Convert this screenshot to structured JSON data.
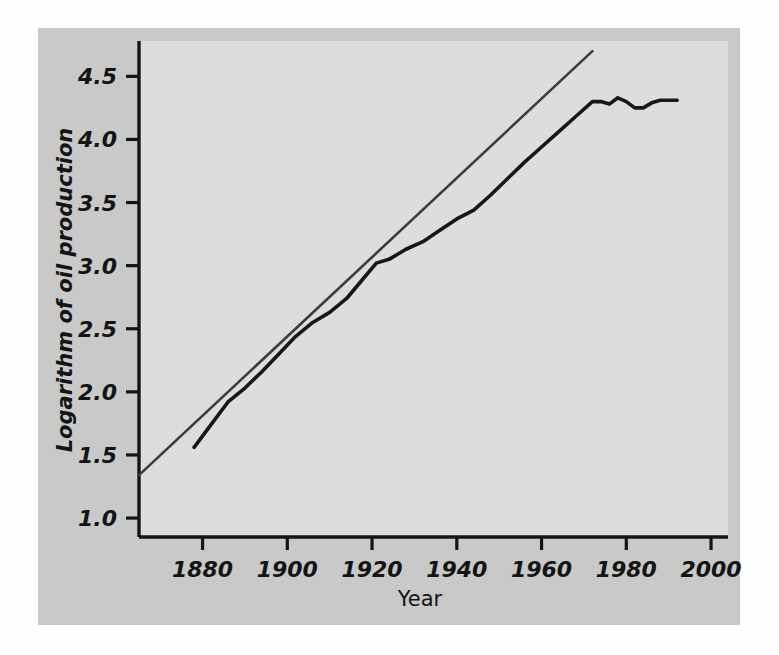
{
  "figure": {
    "background_outer": "#ffffff",
    "background_frame": "#c9c9c9",
    "background_panel": "#dddddd",
    "axis_color": "#141414",
    "data_line_color": "#1a1a1a",
    "fit_line_color": "#3a3a3a"
  },
  "chart_data": {
    "type": "line",
    "title": "",
    "xlabel": "Year",
    "ylabel": "Logarithm of oil production",
    "xlim": [
      1865,
      2004
    ],
    "ylim": [
      0.85,
      4.78
    ],
    "xticks": [
      1880,
      1900,
      1920,
      1940,
      1960,
      1980,
      2000
    ],
    "xticklabels": [
      "1880",
      "1900",
      "1920",
      "1940",
      "1960",
      "1980",
      "2000"
    ],
    "yticks": [
      1.0,
      1.5,
      2.0,
      2.5,
      3.0,
      3.5,
      4.0,
      4.5
    ],
    "yticklabels": [
      "1.0",
      "1.5",
      "2.0",
      "2.5",
      "3.0",
      "3.5",
      "4.0",
      "4.5"
    ],
    "grid": false,
    "legend": "none",
    "series": [
      {
        "name": "Logarithm of oil production",
        "style": "solid-thick",
        "x": [
          1878,
          1882,
          1886,
          1890,
          1894,
          1898,
          1902,
          1906,
          1910,
          1914,
          1918,
          1921,
          1924,
          1928,
          1932,
          1936,
          1940,
          1944,
          1948,
          1952,
          1956,
          1960,
          1964,
          1968,
          1972,
          1974,
          1976,
          1978,
          1980,
          1982,
          1984,
          1986,
          1988,
          1992
        ],
        "y": [
          1.56,
          1.74,
          1.92,
          2.03,
          2.16,
          2.3,
          2.44,
          2.55,
          2.63,
          2.74,
          2.9,
          3.02,
          3.05,
          3.13,
          3.19,
          3.28,
          3.37,
          3.44,
          3.56,
          3.69,
          3.82,
          3.94,
          4.06,
          4.18,
          4.3,
          4.3,
          4.28,
          4.33,
          4.3,
          4.25,
          4.25,
          4.29,
          4.31,
          4.31
        ]
      },
      {
        "name": "Fitted exponential trend",
        "style": "solid-thin",
        "x": [
          1865,
          1972
        ],
        "y": [
          1.34,
          4.7
        ]
      }
    ],
    "annotations": [
      "Oil production grows log-linearly from about 1.56 in 1878 to roughly 4.30 by 1972, then flattens near 4.30 through 1992.",
      "A straight fitted line runs from about 1.34 at 1865 to about 4.70 at 1972, continuing past the data plateau."
    ]
  }
}
